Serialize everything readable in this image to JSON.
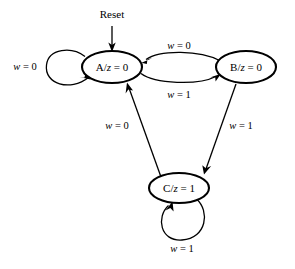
{
  "figure": {
    "type": "finite-state-machine-diagram",
    "background_color": "#ffffff",
    "stroke_color": "#000000",
    "width": 295,
    "height": 269
  },
  "reset": {
    "label": "Reset"
  },
  "states": [
    {
      "id": "A",
      "name": "A",
      "output": "z = 0",
      "label": "A/z = 0",
      "label_var": "z",
      "label_prefix": "A/",
      "label_suffix": " = 0",
      "cx": 112,
      "cy": 67,
      "rx": 30,
      "ry": 16
    },
    {
      "id": "B",
      "name": "B",
      "output": "z = 0",
      "label": "B/z = 0",
      "label_var": "z",
      "label_prefix": "B/",
      "label_suffix": " = 0",
      "cx": 246,
      "cy": 67,
      "rx": 30,
      "ry": 16
    },
    {
      "id": "C",
      "name": "C",
      "output": "z = 1",
      "label": "C/z = 1",
      "label_var": "z",
      "label_prefix": "C/",
      "label_suffix": " = 1",
      "cx": 179,
      "cy": 188,
      "rx": 30,
      "ry": 15
    }
  ],
  "transitions": [
    {
      "id": "a-self",
      "from": "A",
      "to": "A",
      "condition": "w = 0",
      "cond_var": "w",
      "cond_suffix": " = 0",
      "label_x": 25,
      "label_y": 68
    },
    {
      "id": "b-to-a",
      "from": "B",
      "to": "A",
      "condition": "w = 0",
      "cond_var": "w",
      "cond_suffix": " = 0",
      "label_x": 179,
      "label_y": 47
    },
    {
      "id": "a-to-b",
      "from": "A",
      "to": "B",
      "condition": "w = 1",
      "cond_var": "w",
      "cond_suffix": " = 1",
      "label_x": 179,
      "label_y": 96
    },
    {
      "id": "c-to-a",
      "from": "C",
      "to": "A",
      "condition": "w = 0",
      "cond_var": "w",
      "cond_suffix": " = 0",
      "label_x": 117,
      "label_y": 127
    },
    {
      "id": "b-to-c",
      "from": "B",
      "to": "C",
      "condition": "w = 1",
      "cond_var": "w",
      "cond_suffix": " = 1",
      "label_x": 241,
      "label_y": 127
    },
    {
      "id": "c-self",
      "from": "C",
      "to": "C",
      "condition": "w = 1",
      "cond_var": "w",
      "cond_suffix": " = 1",
      "label_x": 182,
      "label_y": 250
    }
  ]
}
